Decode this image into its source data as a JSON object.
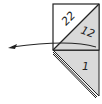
{
  "diagram": {
    "type": "folding-instruction",
    "colors": {
      "stroke": "#222222",
      "shade": "#d9d9d9",
      "background": "#ffffff"
    },
    "labels": {
      "upper_triangle": "22",
      "right_triangle": "12",
      "lower_triangle": "1"
    },
    "arrow": {
      "direction": "left",
      "meaning": "fold-over"
    }
  }
}
